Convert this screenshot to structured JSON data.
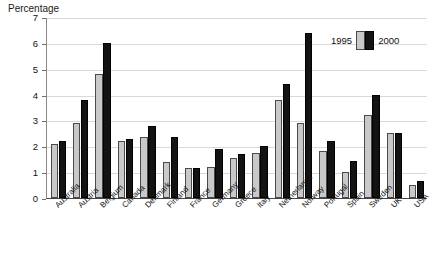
{
  "chart_data": {
    "type": "bar",
    "title": "Percentage",
    "xlabel": "",
    "ylabel": "Percentage",
    "ylim": [
      0,
      7
    ],
    "yticks": [
      "0",
      "1",
      "2",
      "3",
      "4",
      "5",
      "6",
      "7"
    ],
    "grid": true,
    "legend_position": "top-right",
    "categories": [
      "Australia",
      "Austria",
      "Belgium",
      "Canada",
      "Denmark",
      "Finland",
      "France",
      "Germany",
      "Greece",
      "Italy",
      "Netherlands",
      "Norway",
      "Portugal",
      "Spain",
      "Sweden",
      "UK",
      "USA"
    ],
    "series": [
      {
        "name": "1995",
        "color": "#c9c9c9",
        "values": [
          2.1,
          2.9,
          4.8,
          2.2,
          2.35,
          1.4,
          1.15,
          1.2,
          1.55,
          1.75,
          3.8,
          2.9,
          1.8,
          1.0,
          3.2,
          2.5,
          0.5
        ]
      },
      {
        "name": "2000",
        "color": "#131313",
        "values": [
          2.2,
          3.8,
          6.0,
          2.3,
          2.8,
          2.35,
          1.15,
          1.9,
          1.7,
          2.0,
          4.4,
          6.4,
          2.2,
          1.45,
          4.0,
          2.5,
          0.65
        ]
      }
    ]
  },
  "legend": {
    "left_label": "1995",
    "right_label": "2000"
  },
  "colors": {
    "series_1995": "#c9c9c9",
    "series_2000": "#131313",
    "gridline": "#d9d9d9",
    "axis": "#444444",
    "background": "#ffffff"
  }
}
